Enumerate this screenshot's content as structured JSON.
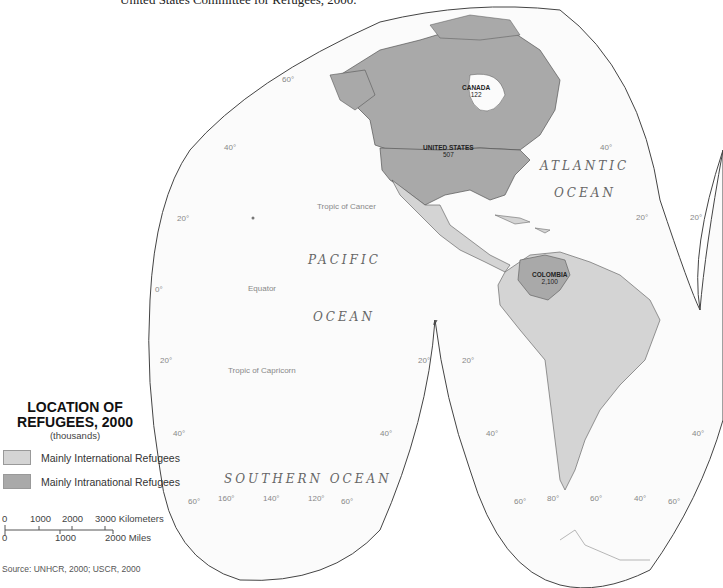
{
  "caption": "United States Committee for Refugees, 2000.",
  "map": {
    "projection": "interrupted homolosine (Americas lobe)",
    "colors": {
      "background": "#ffffff",
      "ocean": "#fafafa",
      "international": "#d4d4d4",
      "intranational": "#a9a9a9",
      "border": "#555555",
      "graticule_label": "#888888"
    },
    "countries": [
      {
        "name": "CANADA",
        "value": "122",
        "category": "intranational"
      },
      {
        "name": "UNITED STATES",
        "value": "507",
        "category": "intranational"
      },
      {
        "name": "COLOMBIA",
        "value": "2,100",
        "category": "intranational"
      }
    ],
    "oceans": {
      "pacific_1": "PACIFIC",
      "pacific_2": "OCEAN",
      "atlantic_1": "ATLANTIC",
      "atlantic_2": "OCEAN",
      "southern": "SOUTHERN OCEAN"
    },
    "lines": {
      "tropic_cancer": "Tropic of Cancer",
      "equator": "Equator",
      "tropic_capricorn": "Tropic of Capricorn"
    },
    "lat_labels": {
      "l60n": "60°",
      "l40n_w": "40°",
      "l20n_w": "20°",
      "l0_w": "0°",
      "l20s_w": "20°",
      "l40s_w": "40°",
      "l60s_w": "60°",
      "l20s_mid_l": "20°",
      "l40s_mid_l": "40°",
      "l20s_mid_r": "20°",
      "l40s_mid_r": "40°",
      "l40n_e": "40°",
      "l20n_e": "20°",
      "l20n_e2": "20°",
      "l40s_e": "40°"
    },
    "lon_labels": {
      "pac_160": "160°",
      "pac_140": "140°",
      "pac_120": "120°",
      "pac_60": "60°",
      "sa_60l": "60°",
      "sa_80": "80°",
      "sa_60": "60°",
      "sa_40": "40°",
      "sa_60r": "60°"
    }
  },
  "legend": {
    "title_1": "LOCATION OF",
    "title_2": "REFUGEES, 2000",
    "subtitle": "(thousands)",
    "items": [
      {
        "label": "Mainly International Refugees",
        "color": "#d4d4d4"
      },
      {
        "label": "Mainly Intranational Refugees",
        "color": "#a9a9a9"
      }
    ]
  },
  "scale_bar": {
    "km_ticks": [
      "0",
      "1000",
      "2000",
      "3000 Kilometers"
    ],
    "mi_ticks": [
      "0",
      "1000",
      "2000 Miles"
    ]
  },
  "source": "Source: UNHCR, 2000; USCR, 2000"
}
